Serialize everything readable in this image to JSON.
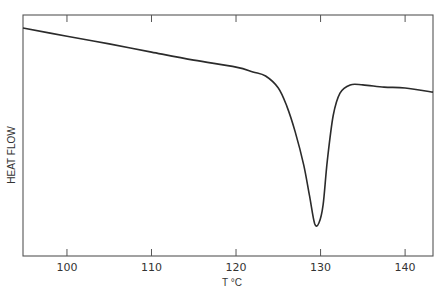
{
  "chart_data": {
    "type": "line",
    "title": "",
    "xlabel": "T °C",
    "ylabel": "HEAT FLOW",
    "xlim": [
      94.8,
      143.3
    ],
    "ylim": [
      0,
      1
    ],
    "x_ticks": [
      100,
      110,
      120,
      130,
      140
    ],
    "x_tick_labels": [
      "100",
      "110",
      "120",
      "130",
      "140"
    ],
    "y_ticks": [],
    "grid": false,
    "legend": null,
    "series": [
      {
        "name": "DSC melting endotherm",
        "x": [
          94.8,
          100,
          105,
          110,
          115,
          120,
          122,
          123.5,
          125,
          126,
          127,
          128,
          128.7,
          129.3,
          129.8,
          130.3,
          130.8,
          131.5,
          132.3,
          133.5,
          135,
          137.5,
          140,
          143.3
        ],
        "y": [
          0.946,
          0.912,
          0.88,
          0.846,
          0.813,
          0.784,
          0.764,
          0.747,
          0.697,
          0.622,
          0.515,
          0.378,
          0.248,
          0.135,
          0.137,
          0.212,
          0.395,
          0.583,
          0.676,
          0.71,
          0.71,
          0.701,
          0.697,
          0.68
        ]
      }
    ],
    "annotations": [
      {
        "text": "endothermic melting peak minimum",
        "x": 129.8,
        "y": 0.137
      }
    ]
  },
  "labels": {
    "ylabel": "HEAT FLOW",
    "xlabel": "T °C",
    "ticks": [
      "100",
      "110",
      "120",
      "130",
      "140"
    ]
  }
}
